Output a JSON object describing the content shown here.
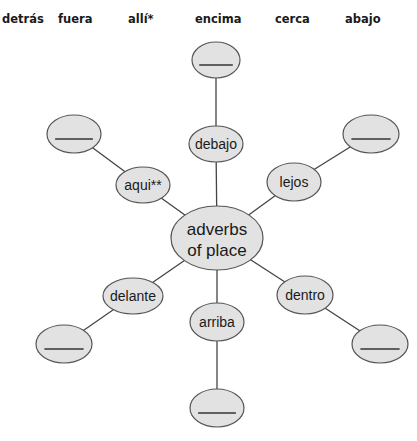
{
  "cropped_header": {
    "note_visible": "descenders of a cut-off line of text"
  },
  "word_bank": {
    "words": [
      {
        "text": "detrás",
        "x": 2
      },
      {
        "text": "fuera",
        "x": 58
      },
      {
        "text": "allí*",
        "x": 128
      },
      {
        "text": "encima",
        "x": 195
      },
      {
        "text": "cerca",
        "x": 275
      },
      {
        "text": "abajo",
        "x": 345
      }
    ]
  },
  "diagram": {
    "colors": {
      "node_fill": "#e2e2e2",
      "node_stroke": "#555555",
      "edge": "#444444",
      "blank_line": "#333333"
    },
    "center": {
      "label_line1": "adverbs",
      "label_line2": "of place",
      "cx": 217,
      "cy": 238,
      "rx": 46,
      "ry": 32
    },
    "spokes": [
      {
        "id": "top",
        "label": "debajo",
        "cx": 216,
        "cy": 144,
        "rx": 27,
        "ry": 18,
        "blank": {
          "label": "______",
          "cx": 216,
          "cy": 60,
          "rx": 24,
          "ry": 18
        }
      },
      {
        "id": "upper-left",
        "label": "aqui**",
        "cx": 143,
        "cy": 185,
        "rx": 27,
        "ry": 18,
        "blank": {
          "label": "______",
          "cx": 74,
          "cy": 134,
          "rx": 27,
          "ry": 19
        }
      },
      {
        "id": "upper-right",
        "label": "lejos",
        "cx": 294,
        "cy": 182,
        "rx": 27,
        "ry": 19,
        "blank": {
          "label": "______",
          "cx": 371,
          "cy": 134,
          "rx": 28,
          "ry": 19
        }
      },
      {
        "id": "lower-left",
        "label": "delante",
        "cx": 133,
        "cy": 296,
        "rx": 30,
        "ry": 18,
        "blank": {
          "label": "______",
          "cx": 64,
          "cy": 344,
          "rx": 28,
          "ry": 19
        }
      },
      {
        "id": "lower-right",
        "label": "dentro",
        "cx": 305,
        "cy": 295,
        "rx": 28,
        "ry": 19,
        "blank": {
          "label": "______",
          "cx": 380,
          "cy": 344,
          "rx": 28,
          "ry": 19
        }
      },
      {
        "id": "bottom",
        "label": "arriba",
        "cx": 217,
        "cy": 322,
        "rx": 27,
        "ry": 19,
        "blank": {
          "label": "______",
          "cx": 217,
          "cy": 408,
          "rx": 27,
          "ry": 19
        }
      }
    ]
  }
}
